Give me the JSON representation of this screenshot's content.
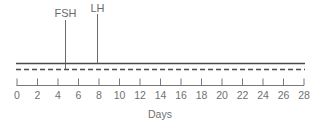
{
  "chart_data": {
    "type": "timeline",
    "title": "",
    "xlabel": "Days",
    "ylabel": "",
    "xlim": [
      0,
      28
    ],
    "x_ticks": [
      0,
      2,
      4,
      6,
      8,
      10,
      12,
      14,
      16,
      18,
      20,
      22,
      24,
      26,
      28
    ],
    "grid": false,
    "series": [
      {
        "name": "solid-line",
        "style": "solid",
        "x": [
          0,
          28
        ]
      },
      {
        "name": "dashed-line",
        "style": "dashed",
        "x": [
          0,
          28
        ]
      }
    ],
    "markers": [
      {
        "label": "FSH",
        "day": 4.7
      },
      {
        "label": "LH",
        "day": 8
      }
    ]
  },
  "labels": {
    "xlabel": "Days",
    "fsh": "FSH",
    "lh": "LH",
    "ticks": [
      "0",
      "2",
      "4",
      "6",
      "8",
      "10",
      "12",
      "14",
      "16",
      "18",
      "20",
      "22",
      "24",
      "26",
      "28"
    ]
  },
  "colors": {
    "line": "#555555",
    "text": "#707070"
  }
}
